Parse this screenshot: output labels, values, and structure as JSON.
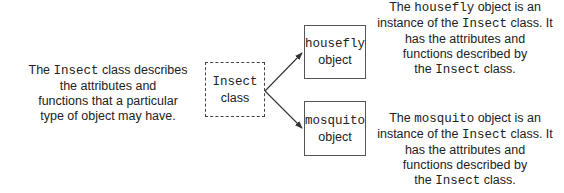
{
  "left_caption": {
    "pre": "The ",
    "code": "Insect",
    "post": " class describes",
    "lines": [
      "the attributes and",
      "functions that a particular",
      "type of object may have."
    ]
  },
  "class_box": {
    "name": "Insect",
    "label": "class"
  },
  "objects": [
    {
      "name": "housefly",
      "label": "object"
    },
    {
      "name": "mosquito",
      "label": "object"
    }
  ],
  "right_captions": [
    {
      "l1_pre": "The ",
      "l1_code": "housefly",
      "l1_post": " object is an",
      "l2_pre": "instance of the ",
      "l2_code": "Insect",
      "l2_post": " class. It",
      "l3": "has the attributes and",
      "l4": "functions described by",
      "l5_pre": "the ",
      "l5_code": "Insect",
      "l5_post": " class."
    },
    {
      "l1_pre": "The ",
      "l1_code": "mosquito",
      "l1_post": " object is an",
      "l2_pre": "instance of the ",
      "l2_code": "Insect",
      "l2_post": " class. It",
      "l3": "has the attributes and",
      "l4": "functions described by",
      "l5_pre": "the ",
      "l5_code": "Insect",
      "l5_post": " class."
    }
  ]
}
